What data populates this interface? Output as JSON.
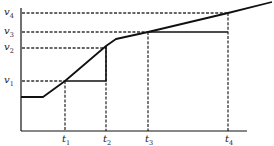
{
  "diagram": {
    "colors": {
      "background": "#ffffff",
      "stroke": "#111111",
      "dash": "#333333",
      "text": "#222222"
    },
    "axes": {
      "origin": [
        21,
        131
      ],
      "y_top": 8,
      "x_right": 247
    },
    "y_levels": [
      {
        "id": "v4",
        "base": "v",
        "sub": "4",
        "y": 13
      },
      {
        "id": "v3",
        "base": "v",
        "sub": "3",
        "y": 32
      },
      {
        "id": "v2",
        "base": "v",
        "sub": "2",
        "y": 48
      },
      {
        "id": "v1",
        "base": "v",
        "sub": "1",
        "y": 81
      }
    ],
    "x_marks": [
      {
        "id": "t1",
        "base": "t",
        "sub": "1",
        "x": 65
      },
      {
        "id": "t2",
        "base": "t",
        "sub": "2",
        "x": 106
      },
      {
        "id": "t3",
        "base": "t",
        "sub": "3",
        "x": 148
      },
      {
        "id": "t4",
        "base": "t",
        "sub": "4",
        "x": 228
      }
    ],
    "curve_points": [
      [
        21,
        97
      ],
      [
        43,
        97
      ],
      [
        65,
        81
      ],
      [
        106,
        46
      ],
      [
        116,
        39
      ],
      [
        148,
        32
      ],
      [
        228,
        13
      ],
      [
        272,
        2
      ]
    ],
    "steps": [
      {
        "name": "step-v1-t1-t2",
        "points": [
          [
            65,
            81
          ],
          [
            106,
            81
          ],
          [
            106,
            46
          ]
        ]
      },
      {
        "name": "step-v3-t3-t4",
        "points": [
          [
            148,
            32
          ],
          [
            228,
            32
          ]
        ]
      }
    ]
  }
}
